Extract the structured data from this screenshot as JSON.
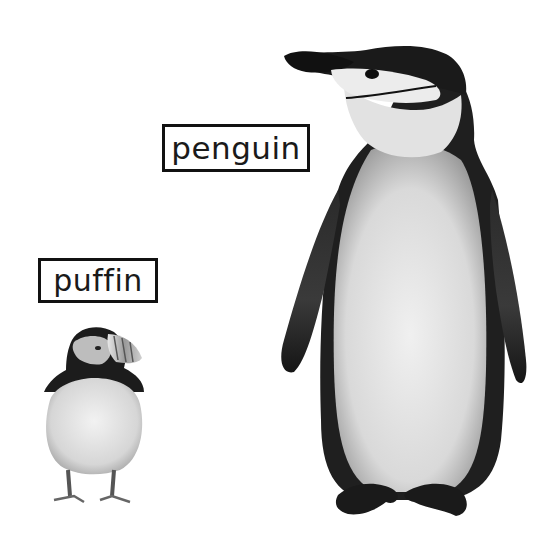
{
  "scene": {
    "background": "#ffffff",
    "labels": [
      {
        "id": "penguin",
        "text": "penguin"
      },
      {
        "id": "puffin",
        "text": "puffin"
      }
    ]
  },
  "animals": [
    {
      "name": "penguin",
      "description": "chinstrap penguin, standing, grayscale photo",
      "relative_size": "large"
    },
    {
      "name": "puffin",
      "description": "atlantic puffin, standing, grayscale photo",
      "relative_size": "small"
    }
  ],
  "colors": {
    "label_border": "#111111",
    "label_text": "#1a1a1a",
    "plumage_dark": "#1c1c1c",
    "plumage_light": "#e6e6e6"
  }
}
